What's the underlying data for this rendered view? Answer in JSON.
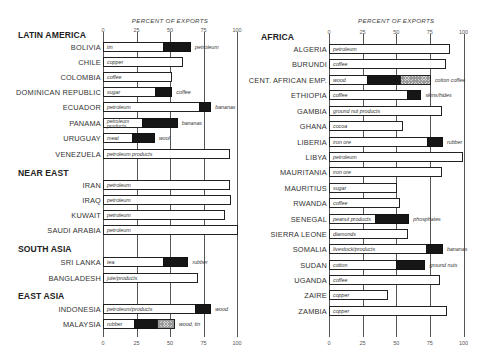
{
  "chart_data": [
    {
      "type": "bar",
      "orientation": "horizontal",
      "stacked": true,
      "title": "",
      "xlabel": "PERCENT OF EXPORTS",
      "ylabel": "",
      "xlim": [
        0,
        100
      ],
      "xticks": [
        "0",
        "25",
        "50",
        "75",
        "100"
      ],
      "grid": true,
      "groups": [
        {
          "region": "LATIN AMERICA",
          "countries": [
            {
              "name": "BOLIVIA",
              "segments": [
                {
                  "label": "tin",
                  "value": 45,
                  "fill": "white"
                },
                {
                  "label": "petroleum",
                  "value": 20,
                  "fill": "black"
                }
              ]
            },
            {
              "name": "CHILE",
              "segments": [
                {
                  "label": "copper",
                  "value": 59,
                  "fill": "white"
                }
              ]
            },
            {
              "name": "COLOMBIA",
              "segments": [
                {
                  "label": "coffee",
                  "value": 51,
                  "fill": "white"
                }
              ]
            },
            {
              "name": "DOMINICAN REPUBLIC",
              "segments": [
                {
                  "label": "sugar",
                  "value": 39,
                  "fill": "white"
                },
                {
                  "label": "coffee",
                  "value": 12,
                  "fill": "black"
                }
              ]
            },
            {
              "name": "ECUADOR",
              "segments": [
                {
                  "label": "petroleum",
                  "value": 72,
                  "fill": "white"
                },
                {
                  "label": "bananas",
                  "value": 8,
                  "fill": "black"
                }
              ]
            },
            {
              "name": "PANAMA",
              "segments": [
                {
                  "label": "petroleum products",
                  "value": 29,
                  "fill": "white"
                },
                {
                  "label": "bananas",
                  "value": 26,
                  "fill": "black"
                }
              ]
            },
            {
              "name": "URUGUAY",
              "segments": [
                {
                  "label": "meat",
                  "value": 22,
                  "fill": "white"
                },
                {
                  "label": "wool",
                  "value": 16,
                  "fill": "black"
                }
              ]
            },
            {
              "name": "VENEZUELA",
              "segments": [
                {
                  "label": "petroleum products",
                  "value": 94,
                  "fill": "white"
                }
              ]
            }
          ]
        },
        {
          "region": "NEAR EAST",
          "countries": [
            {
              "name": "IRAN",
              "segments": [
                {
                  "label": "petroleum",
                  "value": 94,
                  "fill": "white"
                }
              ]
            },
            {
              "name": "IRAQ",
              "segments": [
                {
                  "label": "petroleum",
                  "value": 95,
                  "fill": "white"
                }
              ]
            },
            {
              "name": "KUWAIT",
              "segments": [
                {
                  "label": "petroleum",
                  "value": 90,
                  "fill": "white"
                }
              ]
            },
            {
              "name": "SAUDI ARABIA",
              "segments": [
                {
                  "label": "petroleum",
                  "value": 100,
                  "fill": "white"
                }
              ]
            }
          ]
        },
        {
          "region": "SOUTH ASIA",
          "countries": [
            {
              "name": "SRI LANKA",
              "segments": [
                {
                  "label": "tea",
                  "value": 45,
                  "fill": "white"
                },
                {
                  "label": "rubber",
                  "value": 18,
                  "fill": "black"
                }
              ]
            },
            {
              "name": "BANGLADESH",
              "segments": [
                {
                  "label": "jute/products",
                  "value": 70,
                  "fill": "white"
                }
              ]
            }
          ]
        },
        {
          "region": "EAST ASIA",
          "countries": [
            {
              "name": "INDONESIA",
              "segments": [
                {
                  "label": "petroleum/products",
                  "value": 69,
                  "fill": "white"
                },
                {
                  "label": "wood",
                  "value": 11,
                  "fill": "black"
                }
              ]
            },
            {
              "name": "MALAYSIA",
              "segments": [
                {
                  "label": "rubber",
                  "value": 23,
                  "fill": "white"
                },
                {
                  "label": "wood",
                  "value": 17,
                  "fill": "black"
                },
                {
                  "label": "tin",
                  "value": 13,
                  "fill": "hatch"
                }
              ]
            }
          ]
        }
      ]
    },
    {
      "type": "bar",
      "orientation": "horizontal",
      "stacked": true,
      "title": "",
      "xlabel": "PERCENT OF EXPORTS",
      "ylabel": "",
      "xlim": [
        0,
        100
      ],
      "xticks": [
        "0",
        "25",
        "50",
        "75",
        "100"
      ],
      "grid": true,
      "groups": [
        {
          "region": "AFRICA",
          "countries": [
            {
              "name": "ALGERIA",
              "segments": [
                {
                  "label": "petroleum",
                  "value": 89,
                  "fill": "white"
                }
              ]
            },
            {
              "name": "BURUNDI",
              "segments": [
                {
                  "label": "coffee",
                  "value": 86,
                  "fill": "white"
                }
              ]
            },
            {
              "name": "CENT. AFRICAN EMP.",
              "segments": [
                {
                  "label": "wood",
                  "value": 28,
                  "fill": "white"
                },
                {
                  "label": "cotton",
                  "value": 25,
                  "fill": "black"
                },
                {
                  "label": "coffee",
                  "value": 22,
                  "fill": "hatch"
                }
              ]
            },
            {
              "name": "ETHIOPIA",
              "segments": [
                {
                  "label": "coffee",
                  "value": 58,
                  "fill": "white"
                },
                {
                  "label": "skins/hides",
                  "value": 10,
                  "fill": "black"
                }
              ]
            },
            {
              "name": "GAMBIA",
              "segments": [
                {
                  "label": "ground nut products",
                  "value": 83,
                  "fill": "white"
                }
              ]
            },
            {
              "name": "GHANA",
              "segments": [
                {
                  "label": "cocoa",
                  "value": 54,
                  "fill": "white"
                }
              ]
            },
            {
              "name": "LIBERIA",
              "segments": [
                {
                  "label": "iron ore",
                  "value": 73,
                  "fill": "white"
                },
                {
                  "label": "rubber",
                  "value": 11,
                  "fill": "black"
                }
              ]
            },
            {
              "name": "LIBYA",
              "segments": [
                {
                  "label": "petroleum",
                  "value": 99,
                  "fill": "white"
                }
              ]
            },
            {
              "name": "MAURITANIA",
              "segments": [
                {
                  "label": "iron ore",
                  "value": 83,
                  "fill": "white"
                }
              ]
            },
            {
              "name": "MAURITIUS",
              "segments": [
                {
                  "label": "sugar",
                  "value": 50,
                  "fill": "white"
                }
              ]
            },
            {
              "name": "RWANDA",
              "segments": [
                {
                  "label": "coffee",
                  "value": 52,
                  "fill": "white"
                }
              ]
            },
            {
              "name": "SENEGAL",
              "segments": [
                {
                  "label": "peanut products",
                  "value": 34,
                  "fill": "white"
                },
                {
                  "label": "phosphates",
                  "value": 25,
                  "fill": "black"
                }
              ]
            },
            {
              "name": "SIERRA LEONE",
              "segments": [
                {
                  "label": "diamonds",
                  "value": 58,
                  "fill": "white"
                }
              ]
            },
            {
              "name": "SOMALIA",
              "segments": [
                {
                  "label": "livestock/products",
                  "value": 72,
                  "fill": "white"
                },
                {
                  "label": "bananas",
                  "value": 12,
                  "fill": "black"
                }
              ]
            },
            {
              "name": "SUDAN",
              "segments": [
                {
                  "label": "cotton",
                  "value": 50,
                  "fill": "white"
                },
                {
                  "label": "ground nuts",
                  "value": 21,
                  "fill": "black"
                }
              ]
            },
            {
              "name": "UGANDA",
              "segments": [
                {
                  "label": "coffee",
                  "value": 82,
                  "fill": "white"
                }
              ]
            },
            {
              "name": "ZAIRE",
              "segments": [
                {
                  "label": "copper",
                  "value": 43,
                  "fill": "white"
                }
              ]
            },
            {
              "name": "ZAMBIA",
              "segments": [
                {
                  "label": "copper",
                  "value": 87,
                  "fill": "white"
                }
              ]
            }
          ]
        }
      ]
    }
  ],
  "layout": {
    "left": {
      "axis_x0": 103,
      "px_per_pct": 1.34,
      "top_axis_y": 27,
      "bottom_axis_y": 340,
      "axis_title_y": 17,
      "label_right": 101,
      "headers": [
        {
          "text": "LATIN AMERICA",
          "y": 30
        },
        {
          "text": "NEAR EAST",
          "y": 168
        },
        {
          "text": "SOUTH ASIA",
          "y": 244
        },
        {
          "text": "EAST ASIA",
          "y": 291
        }
      ],
      "row_y": [
        42,
        57,
        72,
        87,
        102,
        118,
        133,
        149,
        180,
        195,
        210,
        225,
        257,
        273,
        304,
        319
      ]
    },
    "right": {
      "axis_x0": 329,
      "px_per_pct": 1.345,
      "top_axis_y": 29,
      "bottom_axis_y": 340,
      "axis_title_y": 17,
      "label_right": 327,
      "headers": [
        {
          "text": "AFRICA",
          "y": 32
        }
      ],
      "row_y": [
        44,
        59,
        75,
        90,
        106,
        121,
        137,
        152,
        167,
        183,
        198,
        214,
        229,
        244,
        260,
        275,
        290,
        306
      ]
    }
  },
  "colors": {
    "ink": "#161616",
    "grid": "#555555",
    "background": "#ffffff",
    "hatch": "#d8d8d8"
  }
}
